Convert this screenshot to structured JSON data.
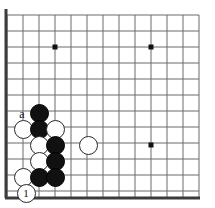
{
  "diagram": {
    "type": "go-board-diagram",
    "board": {
      "background_color": "#ffffff",
      "line_color": "#6b6b6b",
      "border_color": "#3c3c3c",
      "origin_x": 7,
      "origin_y": 15,
      "spacing": 16,
      "cols": 13,
      "rows": 12,
      "border_left_width": 3,
      "border_bottom_width": 3,
      "border_bottom_y": 198
    },
    "star_points": [
      {
        "name": "hoshi-upper-left",
        "cx": 55,
        "cy": 47,
        "size": 5
      },
      {
        "name": "hoshi-upper-right",
        "cx": 151,
        "cy": 47,
        "size": 5
      },
      {
        "name": "hoshi-lower-right",
        "cx": 151,
        "cy": 145,
        "size": 5
      }
    ],
    "stones": [
      {
        "name": "black-stone-1",
        "color": "black",
        "cx": 39,
        "cy": 113,
        "r": 9.5,
        "label": ""
      },
      {
        "name": "white-stone-1",
        "color": "white",
        "cx": 23,
        "cy": 129,
        "r": 9.5,
        "label": ""
      },
      {
        "name": "black-stone-2",
        "color": "black",
        "cx": 39,
        "cy": 129,
        "r": 9.5,
        "label": ""
      },
      {
        "name": "white-stone-2",
        "color": "white",
        "cx": 55,
        "cy": 129,
        "r": 9.5,
        "label": ""
      },
      {
        "name": "white-stone-3",
        "color": "white",
        "cx": 39,
        "cy": 145,
        "r": 9.5,
        "label": ""
      },
      {
        "name": "black-stone-3",
        "color": "black",
        "cx": 55,
        "cy": 145,
        "r": 9.5,
        "label": ""
      },
      {
        "name": "white-stone-4",
        "color": "white",
        "cx": 88,
        "cy": 145,
        "r": 9.5,
        "label": ""
      },
      {
        "name": "white-stone-5",
        "color": "white",
        "cx": 39,
        "cy": 161,
        "r": 9.5,
        "label": ""
      },
      {
        "name": "black-stone-4",
        "color": "black",
        "cx": 55,
        "cy": 161,
        "r": 9.5,
        "label": ""
      },
      {
        "name": "white-stone-6",
        "color": "white",
        "cx": 23,
        "cy": 177,
        "r": 9.5,
        "label": ""
      },
      {
        "name": "black-stone-5",
        "color": "black",
        "cx": 39,
        "cy": 177,
        "r": 9.5,
        "label": ""
      },
      {
        "name": "black-stone-6",
        "color": "black",
        "cx": 55,
        "cy": 177,
        "r": 9.5,
        "label": ""
      },
      {
        "name": "white-stone-move-1",
        "color": "white",
        "cx": 26,
        "cy": 193,
        "r": 9.5,
        "label": "1"
      }
    ],
    "point_labels": [
      {
        "name": "point-label-a",
        "text": "a",
        "cx": 22,
        "cy": 114
      }
    ]
  }
}
